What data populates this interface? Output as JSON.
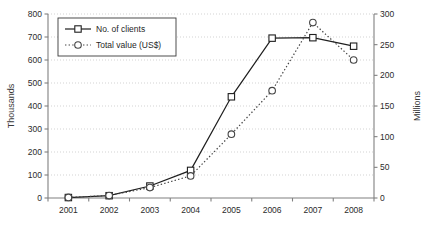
{
  "chart_data": {
    "type": "line",
    "title": "",
    "xlabel": "",
    "categories": [
      "2001",
      "2002",
      "2003",
      "2004",
      "2005",
      "2006",
      "2007",
      "2008"
    ],
    "grid": "horizontal-dotted",
    "legend_position": "top-left",
    "axes": {
      "left": {
        "label": "Thousands",
        "ylim": [
          0,
          800
        ],
        "ticks": [
          0,
          100,
          200,
          300,
          400,
          500,
          600,
          700,
          800
        ],
        "tick_labels": [
          "0",
          "100",
          "200",
          "300",
          "400",
          "500",
          "600",
          "700",
          "800"
        ]
      },
      "right": {
        "label": "Millions",
        "ylim": [
          0,
          300
        ],
        "ticks": [
          0,
          50,
          100,
          150,
          200,
          250,
          300
        ],
        "tick_labels": [
          "0",
          "50",
          "100",
          "150",
          "200",
          "250",
          "300"
        ]
      }
    },
    "series": [
      {
        "name": "No. of clients",
        "axis": "left",
        "unit": "thousands",
        "line_style": "solid",
        "marker": "square-open",
        "color": "#1f1f1f",
        "values": [
          2,
          10,
          52,
          120,
          440,
          695,
          697,
          660
        ]
      },
      {
        "name": "Total value (US$)",
        "axis": "right",
        "unit": "millions",
        "line_style": "dotted",
        "marker": "circle-open",
        "color": "#444444",
        "values": [
          1,
          4,
          17,
          36,
          104,
          175,
          286,
          225
        ]
      }
    ]
  },
  "legend": {
    "items": [
      {
        "label": "No. of clients"
      },
      {
        "label": "Total value (US$)"
      }
    ]
  },
  "colors": {
    "axis": "#808080",
    "grid": "#c8c8c8",
    "series_clients": "#1f1f1f",
    "series_value": "#444444",
    "background": "#ffffff"
  }
}
